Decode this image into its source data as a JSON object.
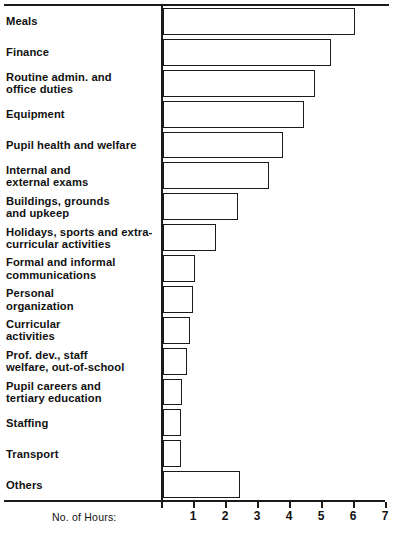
{
  "chart_data": {
    "type": "bar",
    "orientation": "horizontal",
    "title": "",
    "subtitle": "",
    "xlabel": "No. of Hours:",
    "ylabel": "",
    "xlim": [
      0,
      7
    ],
    "xticks": [
      0,
      1,
      2,
      3,
      4,
      5,
      6,
      7
    ],
    "xtick_labels": [
      "",
      "1",
      "2",
      "3",
      "4",
      "5",
      "6",
      "7"
    ],
    "grid": false,
    "legend": null,
    "bar_fill_color": "#ffffff",
    "bar_edge_color": "#1a1a1a",
    "categories": [
      "Meals",
      "Finance",
      "Routine admin. and\noffice duties",
      "Equipment",
      "Pupil health and welfare",
      "Internal and\nexternal exams",
      "Buildings, grounds\nand upkeep",
      "Holidays, sports and extra-\ncurricular activities",
      "Formal and informal\ncommunications",
      "Personal\norganization",
      "Curricular\nactivities",
      "Prof. dev., staff\nwelfare, out-of-school",
      "Pupil careers and\ntertiary education",
      "Staffing",
      "Transport",
      "Others"
    ],
    "values": [
      6.0,
      5.25,
      4.75,
      4.4,
      3.75,
      3.3,
      2.35,
      1.65,
      1.0,
      0.95,
      0.85,
      0.75,
      0.6,
      0.55,
      0.55,
      2.4
    ]
  },
  "axis": {
    "caption": "No. of Hours:"
  }
}
